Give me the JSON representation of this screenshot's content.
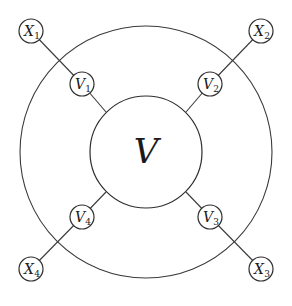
{
  "diagram": {
    "center": {
      "label": "V"
    },
    "outer_ring": {
      "cx": 146,
      "cy": 152,
      "r": 126
    },
    "inner_circle": {
      "cx": 146,
      "cy": 152,
      "r": 56
    },
    "nodes": [
      {
        "id": "V1",
        "base": "V",
        "sub": "1",
        "cx": 82,
        "cy": 84,
        "r": 12
      },
      {
        "id": "V2",
        "base": "V",
        "sub": "2",
        "cx": 210,
        "cy": 84,
        "r": 12
      },
      {
        "id": "V3",
        "base": "V",
        "sub": "3",
        "cx": 210,
        "cy": 217,
        "r": 12
      },
      {
        "id": "V4",
        "base": "V",
        "sub": "4",
        "cx": 82,
        "cy": 217,
        "r": 12
      },
      {
        "id": "X1",
        "base": "X",
        "sub": "1",
        "cx": 31,
        "cy": 31,
        "r": 12
      },
      {
        "id": "X2",
        "base": "X",
        "sub": "2",
        "cx": 261,
        "cy": 31,
        "r": 12
      },
      {
        "id": "X3",
        "base": "X",
        "sub": "3",
        "cx": 261,
        "cy": 269,
        "r": 12
      },
      {
        "id": "X4",
        "base": "X",
        "sub": "4",
        "cx": 31,
        "cy": 269,
        "r": 12
      }
    ],
    "edges": [
      {
        "from": "X1",
        "to": "V1"
      },
      {
        "from": "V1",
        "to": "V"
      },
      {
        "from": "X2",
        "to": "V2"
      },
      {
        "from": "V2",
        "to": "V"
      },
      {
        "from": "X3",
        "to": "V3"
      },
      {
        "from": "V3",
        "to": "V"
      },
      {
        "from": "X4",
        "to": "V4"
      },
      {
        "from": "V4",
        "to": "V"
      }
    ]
  }
}
